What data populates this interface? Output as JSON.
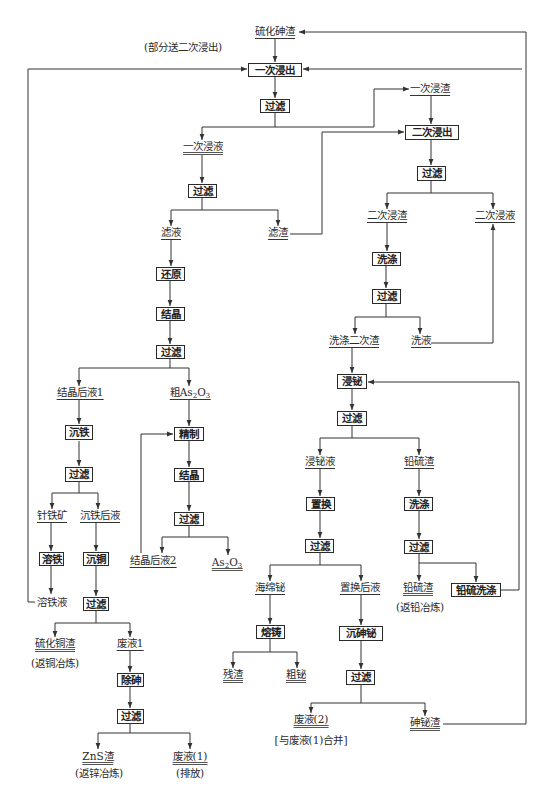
{
  "diagram": {
    "type": "process-flowsheet",
    "line_color": "#333333",
    "box_border_color": "#2a2a2a",
    "background": "#ffffff"
  },
  "steps": {
    "leach1": "一次浸出",
    "leach2": "二次浸出",
    "filter": "过滤",
    "wash1": "洗涤",
    "reduce": "还原",
    "crystallize1": "结晶",
    "fe_precip": "沉铁",
    "refine": "精制",
    "crystallize2": "结晶",
    "fe_dissolve": "溶铁",
    "cu_precip": "沉铜",
    "as_removal": "除砷",
    "bi_leach": "浸铋",
    "cementation": "置换",
    "wash2": "洗涤",
    "pbs_wash": "铅硫洗涤",
    "melt_cast": "熔铸",
    "as_bi_precip": "沉砷铋"
  },
  "materials": {
    "as_sulfide_residue": "硫化砷渣",
    "leach1_residue": "一次浸渣",
    "leach1_liquor": "一次浸液",
    "filtrate": "滤液",
    "filter_residue": "滤渣",
    "leach2_residue": "二次浸渣",
    "leach2_liquor": "二次浸液",
    "washed_leach2_residue": "洗涤二次渣",
    "wash_liquor": "洗液",
    "mother_liquor1": "结晶后液1",
    "crude_as2o3": {
      "prefix": "粗As",
      "sub1": "2",
      "mid": "O",
      "sub2": "3"
    },
    "goethite": "针铁矿",
    "after_fe_liquor": "沉铁后液",
    "mother_liquor2": "结晶后液2",
    "as2o3": {
      "prefix": "As",
      "sub1": "2",
      "mid": "O",
      "sub2": "3"
    },
    "fe_dissolve_liquor": "溶铁液",
    "cus_residue": "硫化铜渣",
    "waste_liquor1": "废液1",
    "zns_residue": "ZnS渣",
    "waste_1": "废液(1)",
    "bi_leach_liquor": "浸铋液",
    "pbs_residue": "铅硫渣",
    "sponge_bi": "海绵铋",
    "after_cementation_liquor": "置换后液",
    "pbs_residue_final": "铅硫渣",
    "residue": "残渣",
    "crude_bi": "粗铋",
    "waste_2": "废液(2)",
    "as_bi_residue": "砷铋渣"
  },
  "notes": {
    "partial_to_leach2": "(部分送二次浸出)",
    "return_cu": "(返铜冶炼)",
    "return_zn": "(返锌冶炼)",
    "discharge": "(排放)",
    "return_pb": "(返铅冶炼)",
    "merge_waste1": "[与废液(1)合并]"
  }
}
